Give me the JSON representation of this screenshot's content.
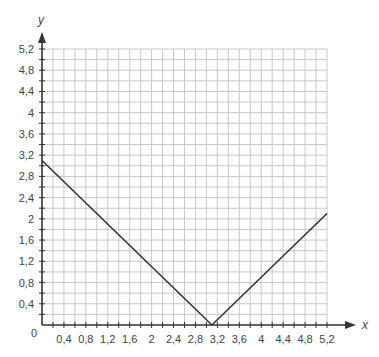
{
  "chart_data": {
    "type": "line",
    "title": "",
    "xlabel": "x",
    "ylabel": "y",
    "xlim": [
      0,
      5.2
    ],
    "ylim": [
      0,
      5.2
    ],
    "grid": true,
    "grid_step": 0.2,
    "origin_label": "0",
    "x_ticks": [
      0.4,
      0.8,
      1.2,
      1.6,
      2,
      2.4,
      2.8,
      3.2,
      3.6,
      4,
      4.4,
      4.8,
      5.2
    ],
    "x_tick_labels": [
      "0,4",
      "0,8",
      "1,2",
      "1,6",
      "2",
      "2,4",
      "2,8",
      "3,2",
      "3,6",
      "4",
      "4,4",
      "4,8",
      "5,2"
    ],
    "y_ticks": [
      0.4,
      0.8,
      1.2,
      1.6,
      2,
      2.4,
      2.8,
      3.2,
      3.6,
      4,
      4.4,
      4.8,
      5.2
    ],
    "y_tick_labels": [
      "0,4",
      "0,8",
      "1,2",
      "1,6",
      "2",
      "2,4",
      "2,8",
      "3,2",
      "3,6",
      "4",
      "4,4",
      "4,8",
      "5,2"
    ],
    "series": [
      {
        "name": "y = |x - 3,1|",
        "x": [
          0,
          3.1,
          5.2
        ],
        "y": [
          3.1,
          0,
          2.1
        ],
        "color": "#333333"
      }
    ],
    "legend": null
  },
  "colors": {
    "grid": "#c8c8c8",
    "axis": "#333333",
    "line": "#333333",
    "text": "#444444"
  }
}
